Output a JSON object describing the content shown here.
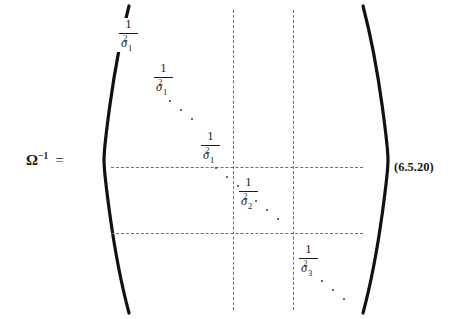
{
  "equation": {
    "lhs": {
      "symbol": "Ω",
      "exponent": "−1",
      "equals": "="
    },
    "number": "(6.5.20)",
    "matrix": {
      "bracket_left": "left-parenthesis",
      "bracket_right": "right-parenthesis",
      "blocks": [
        {
          "name": "block-1",
          "entries": [
            {
              "numerator": "1",
              "denominator_base": "σ",
              "denominator_sub": "1",
              "denominator_sup": "2"
            },
            {
              "numerator": "1",
              "denominator_base": "σ",
              "denominator_sub": "1",
              "denominator_sup": "2"
            },
            {
              "numerator": "1",
              "denominator_base": "σ",
              "denominator_sub": "1",
              "denominator_sup": "2"
            }
          ]
        },
        {
          "name": "block-2",
          "entries": [
            {
              "numerator": "1",
              "denominator_base": "σ",
              "denominator_sub": "2",
              "denominator_sup": "2"
            }
          ]
        },
        {
          "name": "block-3",
          "entries": [
            {
              "numerator": "1",
              "denominator_base": "σ",
              "denominator_sub": "3",
              "denominator_sup": "2"
            }
          ]
        }
      ],
      "ellipses": [
        {
          "name": "ellipsis-block-1",
          "dots": 3
        },
        {
          "name": "ellipsis-block-1-to-2",
          "dots": 3
        },
        {
          "name": "ellipsis-block-2-to-3",
          "dots": 3
        },
        {
          "name": "ellipsis-block-3-trailing",
          "dots": 3
        }
      ],
      "gridlines": {
        "vertical": 2,
        "horizontal": 2,
        "style": "dashed"
      }
    }
  }
}
